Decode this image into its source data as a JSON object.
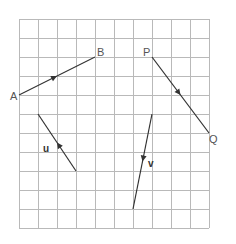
{
  "grid": {
    "origin_x": 19,
    "origin_y": 19,
    "cell": 19,
    "cols": 10,
    "rows": 11,
    "color": "#b9b9b9"
  },
  "points": {
    "A": {
      "label": "A",
      "x": 19,
      "y": 95
    },
    "B": {
      "label": "B",
      "x": 95,
      "y": 57
    },
    "P": {
      "label": "P",
      "x": 152,
      "y": 57
    },
    "Q": {
      "label": "Q",
      "x": 209,
      "y": 133
    }
  },
  "vectors": [
    {
      "name": "AB",
      "from": [
        19,
        95
      ],
      "to": [
        95,
        57
      ],
      "label": ""
    },
    {
      "name": "PQ",
      "from": [
        152,
        57
      ],
      "to": [
        209,
        133
      ],
      "label": ""
    },
    {
      "name": "u",
      "from": [
        76,
        171
      ],
      "to": [
        38,
        114
      ],
      "label": "u"
    },
    {
      "name": "v",
      "from": [
        152,
        114
      ],
      "to": [
        133,
        209
      ],
      "label": "v"
    }
  ],
  "labels": {
    "A": "A",
    "B": "B",
    "P": "P",
    "Q": "Q",
    "u": "u",
    "v": "v"
  },
  "colors": {
    "line": "#333333",
    "label": "#555555",
    "grid": "#b9b9b9"
  }
}
